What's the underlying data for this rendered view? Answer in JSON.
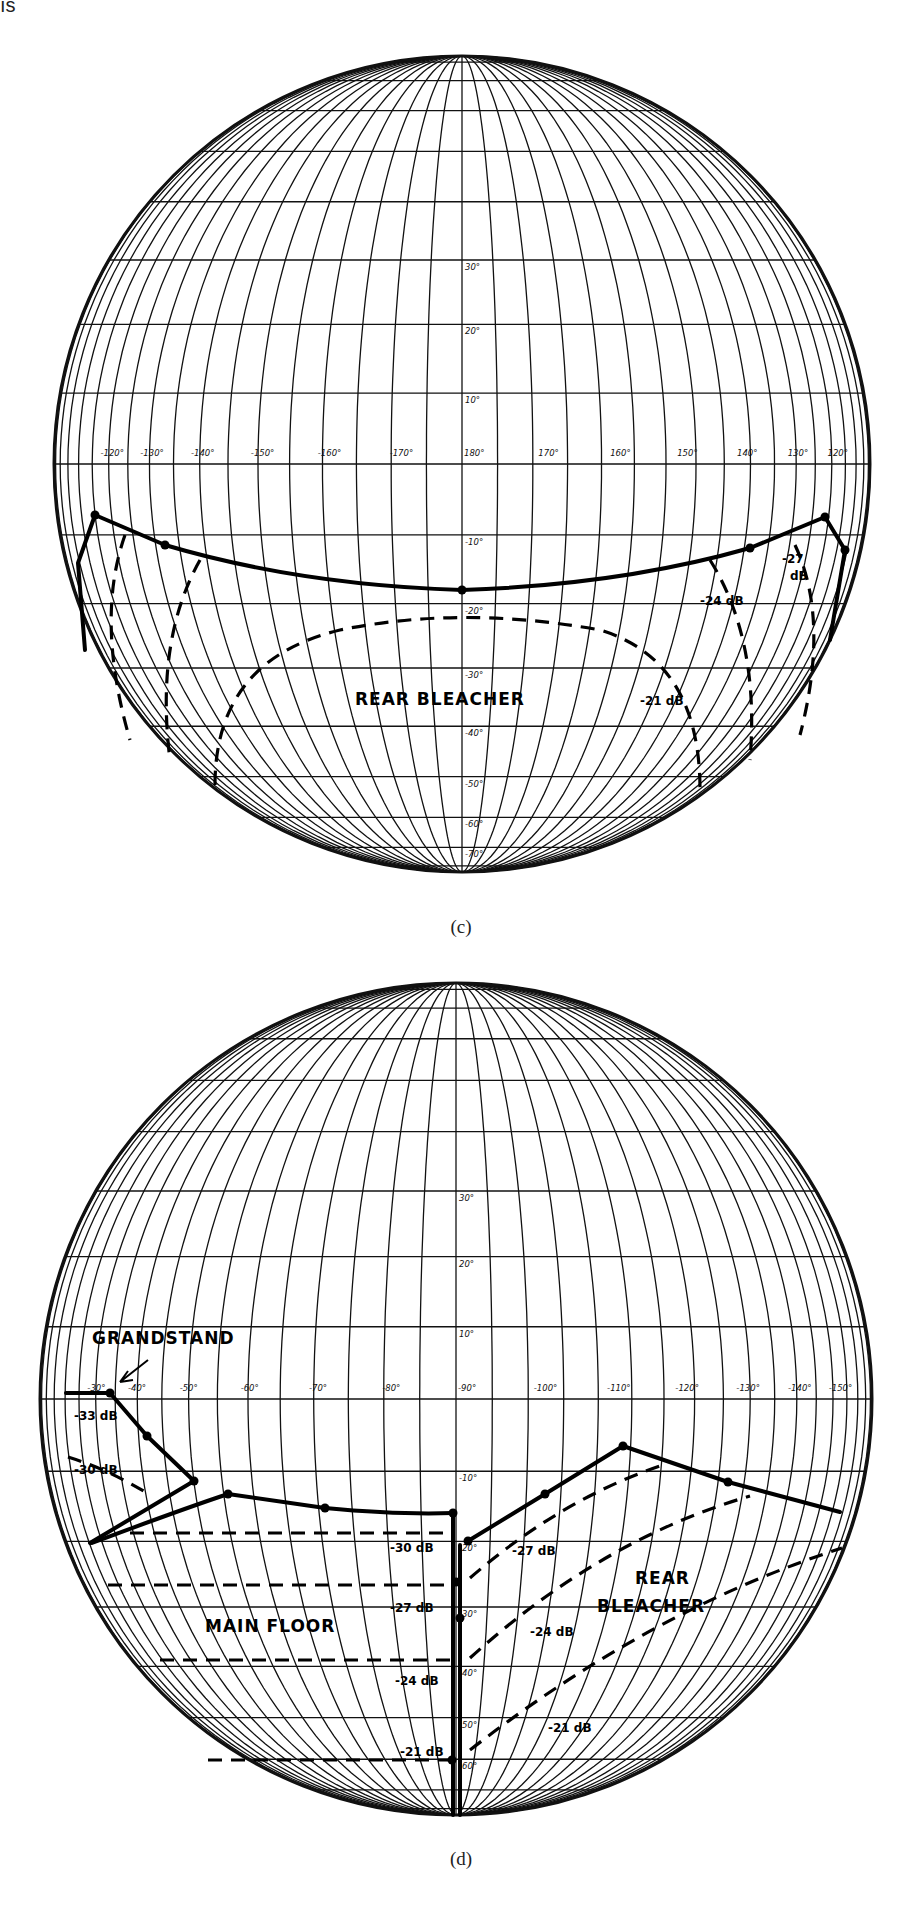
{
  "page": {
    "page_number_fragment": "ıs"
  },
  "figures": [
    {
      "id": "c",
      "caption": "(c)",
      "globe": {
        "cx": 462,
        "cy": 464,
        "r": 408
      },
      "equator_labels": [
        "-120°",
        "-130°",
        "-140°",
        "-150°",
        "-160°",
        "-170°",
        "180°",
        "170°",
        "160°",
        "150°",
        "140°",
        "130°",
        "120°"
      ],
      "latitude_labels": [
        "30°",
        "20°",
        "10°",
        "-10°",
        "-20°",
        "-30°",
        "-40°",
        "-50°",
        "-60°",
        "-70°"
      ],
      "region_labels": [
        {
          "text": "REAR BLEACHER",
          "x": 355,
          "y": 705
        }
      ],
      "contour_labels": [
        {
          "text": "-21 dB",
          "x": 640,
          "y": 705
        },
        {
          "text": "-24 dB",
          "x": 700,
          "y": 605
        },
        {
          "text": "-27",
          "x": 782,
          "y": 563
        },
        {
          "text": "dB",
          "x": 790,
          "y": 580
        }
      ]
    },
    {
      "id": "d",
      "caption": "(d)",
      "globe": {
        "cx": 456,
        "cy": 1399,
        "r": 416
      },
      "equator_labels": [
        "-30°",
        "-40°",
        "-50°",
        "-60°",
        "-70°",
        "-80°",
        "-90°",
        "-100°",
        "-110°",
        "-120°",
        "-130°",
        "-140°",
        "-150°"
      ],
      "latitude_labels": [
        "30°",
        "20°",
        "10°",
        "-10°",
        "-20°",
        "-30°",
        "-40°",
        "-50°",
        "-60°"
      ],
      "region_labels": [
        {
          "text": "GRANDSTAND",
          "x": 92,
          "y": 1344,
          "size": 13
        },
        {
          "text": "MAIN FLOOR",
          "x": 205,
          "y": 1632
        },
        {
          "text": "REAR",
          "x": 635,
          "y": 1584
        },
        {
          "text": "BLEACHER",
          "x": 597,
          "y": 1612
        }
      ],
      "contour_labels": [
        {
          "text": "-33 dB",
          "x": 74,
          "y": 1420
        },
        {
          "text": "-30 dB",
          "x": 74,
          "y": 1474
        },
        {
          "text": "-30 dB",
          "x": 390,
          "y": 1552
        },
        {
          "text": "-27 dB",
          "x": 390,
          "y": 1612
        },
        {
          "text": "-24 dB",
          "x": 395,
          "y": 1685
        },
        {
          "text": "-21 dB",
          "x": 400,
          "y": 1756
        },
        {
          "text": "-27 dB",
          "x": 512,
          "y": 1555
        },
        {
          "text": "-24 dB",
          "x": 530,
          "y": 1636
        },
        {
          "text": "-21 dB",
          "x": 548,
          "y": 1732
        }
      ]
    }
  ],
  "chart_data": [
    {
      "type": "diagram",
      "title": "(c)",
      "description": "Spherical (orthographic) coordinate globe, longitude 120°→180°→120°, latitude 30° to -70°, showing Rear Bleacher sound level contours",
      "regions": [
        "REAR BLEACHER"
      ],
      "contours_dB": [
        -21,
        -24,
        -27
      ],
      "x_ticks": [
        "-120°",
        "-130°",
        "-140°",
        "-150°",
        "-160°",
        "-170°",
        "180°",
        "170°",
        "160°",
        "150°",
        "140°",
        "130°",
        "120°"
      ],
      "y_ticks": [
        "30°",
        "20°",
        "10°",
        "-10°",
        "-20°",
        "-30°",
        "-40°",
        "-50°",
        "-60°",
        "-70°"
      ]
    },
    {
      "type": "diagram",
      "title": "(d)",
      "description": "Spherical coordinate globe, longitude -30° to -150°, latitude 30° to -60°, showing Grandstand, Main Floor and Rear Bleacher contours",
      "regions": [
        "GRANDSTAND",
        "MAIN FLOOR",
        "REAR BLEACHER"
      ],
      "contours_dB": [
        -33,
        -30,
        -27,
        -24,
        -21
      ],
      "x_ticks": [
        "-30°",
        "-40°",
        "-50°",
        "-60°",
        "-70°",
        "-80°",
        "-90°",
        "-100°",
        "-110°",
        "-120°",
        "-130°",
        "-140°",
        "-150°"
      ],
      "y_ticks": [
        "30°",
        "20°",
        "10°",
        "-10°",
        "-20°",
        "-30°",
        "-40°",
        "-50°",
        "-60°"
      ]
    }
  ]
}
